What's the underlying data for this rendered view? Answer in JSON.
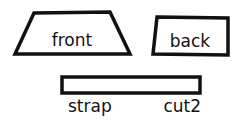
{
  "diagram": {
    "type": "sewing-pattern-pieces",
    "background": "#ffffff",
    "ink": "#111111",
    "pieces": [
      {
        "id": "front",
        "label": "front",
        "shape": "trapezoid"
      },
      {
        "id": "back",
        "label": "back",
        "shape": "rectangle"
      },
      {
        "id": "strap",
        "label": "strap",
        "shape": "long-rectangle",
        "note": "cut2"
      }
    ]
  }
}
